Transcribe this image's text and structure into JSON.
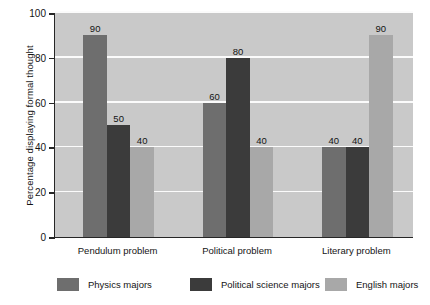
{
  "chart_data": {
    "type": "bar",
    "title": "",
    "xlabel": "",
    "ylabel": "Percentage displaying formal thought",
    "ylim": [
      0,
      100
    ],
    "yticks": [
      0,
      20,
      40,
      60,
      80,
      100
    ],
    "ytick_labels": [
      "0",
      "20",
      "40",
      "60",
      "80",
      "100"
    ],
    "grid": true,
    "legend_position": "bottom",
    "categories": [
      "Pendulum problem",
      "Political problem",
      "Literary problem"
    ],
    "series": [
      {
        "name": "Physics majors",
        "color": "#6e6e6e",
        "values": [
          90,
          60,
          40
        ],
        "labels": [
          "90",
          "60",
          "40"
        ]
      },
      {
        "name": "Political science majors",
        "color": "#3b3b3b",
        "values": [
          50,
          80,
          40
        ],
        "labels": [
          "50",
          "80",
          "40"
        ]
      },
      {
        "name": "English majors",
        "color": "#a8a8a8",
        "values": [
          40,
          40,
          90
        ],
        "labels": [
          "40",
          "40",
          "90"
        ]
      }
    ]
  },
  "style": {
    "plot_background": "#c9c9c9",
    "gridline_color": "#fbfbfb",
    "axis_color": "#262626",
    "page_background": "#ffffff"
  }
}
